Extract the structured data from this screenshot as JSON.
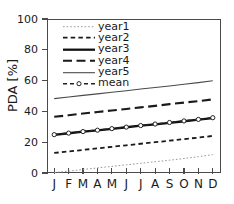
{
  "chart_data": {
    "type": "line",
    "title": "",
    "xlabel": "",
    "ylabel": "PDA [%]",
    "categories": [
      "J",
      "F",
      "M",
      "A",
      "M",
      "J",
      "J",
      "A",
      "S",
      "O",
      "N",
      "D"
    ],
    "xtick_labels": [
      "J",
      "F",
      "M",
      "A",
      "M",
      "J",
      "J",
      "A",
      "S",
      "O",
      "N",
      "D"
    ],
    "ytick_labels": [
      "0",
      "20",
      "40",
      "60",
      "80",
      "100"
    ],
    "ytick_values": [
      0,
      20,
      40,
      60,
      80,
      100
    ],
    "ylim": [
      0,
      100
    ],
    "grid": false,
    "legend_position": "upper-left-inside",
    "series": [
      {
        "name": "year1",
        "style": "dotted",
        "color": "#999999",
        "width": 1.0,
        "marker": "none",
        "values": [
          0.3,
          1.2,
          2.3,
          3.3,
          4.3,
          5.3,
          6.3,
          7.3,
          8.3,
          9.4,
          10.6,
          11.9
        ]
      },
      {
        "name": "year2",
        "style": "dashed",
        "color": "#1a1a1a",
        "width": 1.8,
        "marker": "none",
        "values": [
          13.0,
          14.0,
          15.0,
          16.0,
          17.0,
          18.0,
          19.0,
          20.0,
          21.0,
          22.0,
          23.0,
          24.1
        ]
      },
      {
        "name": "year3",
        "style": "solid",
        "color": "#111111",
        "width": 2.3,
        "marker": "none",
        "values": [
          24.8,
          25.8,
          26.8,
          27.7,
          28.7,
          29.7,
          30.7,
          31.6,
          32.6,
          33.6,
          34.6,
          35.6
        ]
      },
      {
        "name": "year4",
        "style": "longdash",
        "color": "#1a1a1a",
        "width": 2.1,
        "marker": "none",
        "values": [
          36.5,
          37.5,
          38.6,
          39.6,
          40.6,
          41.6,
          42.6,
          43.6,
          44.7,
          45.7,
          46.7,
          47.8
        ]
      },
      {
        "name": "year5",
        "style": "solid-thin",
        "color": "#4a4a4a",
        "width": 1.1,
        "marker": "none",
        "values": [
          48.3,
          49.4,
          50.4,
          51.4,
          52.4,
          53.4,
          54.5,
          55.5,
          56.5,
          57.6,
          58.7,
          59.9
        ]
      },
      {
        "name": "mean",
        "style": "dash-marker",
        "color": "#222222",
        "width": 1.5,
        "marker": "circle",
        "values": [
          24.9,
          25.9,
          26.9,
          27.8,
          28.8,
          29.8,
          30.8,
          31.8,
          32.8,
          33.8,
          34.8,
          35.9
        ]
      }
    ]
  },
  "axis": {
    "ylabel": "PDA [%]"
  },
  "legend": {
    "items": [
      {
        "label": "year1"
      },
      {
        "label": "year2"
      },
      {
        "label": "year3"
      },
      {
        "label": "year4"
      },
      {
        "label": "year5"
      },
      {
        "label": "mean"
      }
    ]
  }
}
